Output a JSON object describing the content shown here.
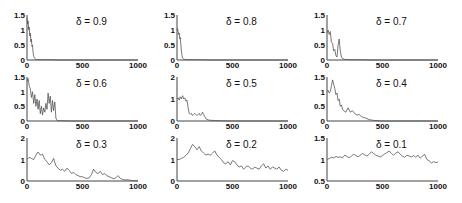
{
  "figure": {
    "title": "",
    "rows": 3,
    "cols": 3
  },
  "chart_data": [
    {
      "type": "line",
      "title": "δ = 0.9",
      "xlabel": "",
      "ylabel": "",
      "xlim": [
        0,
        1000
      ],
      "ylim": [
        0,
        1.5
      ],
      "xticks": [
        "0",
        "500",
        "1000"
      ],
      "yticks": [
        "0",
        "0.5",
        "1",
        "1.5"
      ],
      "x": [
        0,
        5,
        10,
        15,
        20,
        25,
        30,
        35,
        40,
        45,
        50,
        55,
        60,
        70,
        80,
        100,
        200,
        300,
        400,
        500,
        600,
        700,
        800,
        900,
        1000
      ],
      "values": [
        1.4,
        1.2,
        1.3,
        1.0,
        1.1,
        0.8,
        0.9,
        0.6,
        0.7,
        0.45,
        0.5,
        0.25,
        0.12,
        0.05,
        0.02,
        0.01,
        0.01,
        0.0,
        0.0,
        0.0,
        0.0,
        0.0,
        0.0,
        0.0,
        0.0
      ]
    },
    {
      "type": "line",
      "title": "δ = 0.8",
      "xlabel": "",
      "ylabel": "",
      "xlim": [
        0,
        1000
      ],
      "ylim": [
        0,
        1.5
      ],
      "xticks": [
        "0",
        "500",
        "1000"
      ],
      "yticks": [
        "0",
        "0.5",
        "1",
        "1.5"
      ],
      "x": [
        0,
        5,
        10,
        15,
        20,
        25,
        30,
        35,
        40,
        45,
        50,
        60,
        70,
        100,
        200,
        300,
        400,
        500,
        600,
        700,
        800,
        900,
        1000
      ],
      "values": [
        1.0,
        1.05,
        0.95,
        0.85,
        0.9,
        0.7,
        0.75,
        0.5,
        0.3,
        0.15,
        0.06,
        0.03,
        0.02,
        0.01,
        0.01,
        0.0,
        0.0,
        0.0,
        0.0,
        0.0,
        0.0,
        0.0,
        0.0
      ]
    },
    {
      "type": "line",
      "title": "δ = 0.7",
      "xlabel": "",
      "ylabel": "",
      "xlim": [
        0,
        1000
      ],
      "ylim": [
        0,
        1.5
      ],
      "xticks": [
        "0",
        "500",
        "1000"
      ],
      "yticks": [
        "0",
        "0.5",
        "1",
        "1.5"
      ],
      "x": [
        0,
        10,
        20,
        30,
        40,
        50,
        60,
        70,
        80,
        90,
        100,
        110,
        120,
        130,
        140,
        160,
        200,
        300,
        400,
        500,
        600,
        700,
        800,
        900,
        1000
      ],
      "values": [
        0.9,
        1.0,
        0.85,
        0.95,
        0.6,
        0.55,
        0.3,
        0.35,
        0.15,
        0.1,
        0.5,
        0.7,
        0.3,
        0.1,
        0.05,
        0.02,
        0.01,
        0.01,
        0.0,
        0.0,
        0.0,
        0.0,
        0.0,
        0.0,
        0.0
      ]
    },
    {
      "type": "line",
      "title": "δ = 0.6",
      "xlabel": "",
      "ylabel": "",
      "xlim": [
        0,
        1000
      ],
      "ylim": [
        0,
        1.5
      ],
      "xticks": [
        "0",
        "500",
        "1000"
      ],
      "yticks": [
        "0",
        "0.5",
        "1",
        "1.5"
      ],
      "x": [
        0,
        10,
        20,
        30,
        40,
        50,
        60,
        70,
        80,
        90,
        100,
        110,
        120,
        130,
        140,
        150,
        160,
        170,
        180,
        190,
        200,
        210,
        220,
        230,
        240,
        250,
        260,
        270,
        280,
        300,
        400,
        500,
        600,
        700,
        800,
        900,
        1000
      ],
      "values": [
        1.35,
        1.45,
        1.2,
        1.1,
        0.8,
        1.0,
        0.6,
        0.9,
        0.5,
        0.75,
        0.4,
        0.7,
        0.25,
        0.5,
        0.2,
        0.45,
        0.3,
        0.6,
        0.4,
        0.95,
        0.6,
        0.85,
        0.3,
        0.7,
        0.35,
        0.65,
        0.1,
        0.02,
        0.01,
        0.01,
        0.0,
        0.0,
        0.0,
        0.0,
        0.0,
        0.0,
        0.0
      ]
    },
    {
      "type": "line",
      "title": "δ = 0.5",
      "xlabel": "",
      "ylabel": "",
      "xlim": [
        0,
        1000
      ],
      "ylim": [
        0,
        2
      ],
      "xticks": [
        "0",
        "500",
        "1000"
      ],
      "yticks": [
        "0",
        "1",
        "2"
      ],
      "x": [
        0,
        10,
        20,
        30,
        40,
        50,
        60,
        70,
        80,
        90,
        100,
        110,
        120,
        130,
        140,
        150,
        160,
        170,
        180,
        190,
        200,
        210,
        220,
        230,
        240,
        250,
        260,
        280,
        300,
        400,
        500,
        600,
        700,
        800,
        900,
        1000
      ],
      "values": [
        1.0,
        1.05,
        0.95,
        1.1,
        1.0,
        1.15,
        1.0,
        1.05,
        0.9,
        0.95,
        0.6,
        0.35,
        0.3,
        0.35,
        0.25,
        0.3,
        0.35,
        0.3,
        0.25,
        0.3,
        0.35,
        0.25,
        0.3,
        0.4,
        0.3,
        0.2,
        0.1,
        0.05,
        0.03,
        0.01,
        0.0,
        0.0,
        0.0,
        0.0,
        0.0,
        0.0
      ]
    },
    {
      "type": "line",
      "title": "δ = 0.4",
      "xlabel": "",
      "ylabel": "",
      "xlim": [
        0,
        1000
      ],
      "ylim": [
        0,
        1.5
      ],
      "xticks": [
        "0",
        "500",
        "1000"
      ],
      "yticks": [
        "0",
        "0.5",
        "1",
        "1.5"
      ],
      "x": [
        0,
        10,
        20,
        30,
        40,
        50,
        60,
        70,
        80,
        90,
        100,
        110,
        120,
        130,
        140,
        150,
        170,
        190,
        210,
        230,
        250,
        270,
        290,
        310,
        330,
        350,
        370,
        390,
        420,
        460,
        500,
        600,
        700,
        800,
        900,
        1000
      ],
      "values": [
        1.0,
        1.05,
        0.95,
        1.0,
        1.2,
        1.4,
        1.25,
        1.1,
        0.9,
        0.95,
        0.7,
        0.75,
        0.5,
        0.55,
        0.4,
        0.35,
        0.3,
        0.45,
        0.3,
        0.35,
        0.25,
        0.2,
        0.22,
        0.15,
        0.12,
        0.1,
        0.06,
        0.04,
        0.02,
        0.01,
        0.0,
        0.0,
        0.0,
        0.0,
        0.0,
        0.0
      ]
    },
    {
      "type": "line",
      "title": "δ = 0.3",
      "xlabel": "",
      "ylabel": "",
      "xlim": [
        0,
        1000
      ],
      "ylim": [
        0,
        2
      ],
      "xticks": [
        "0",
        "500",
        "1000"
      ],
      "yticks": [
        "0",
        "1",
        "2"
      ],
      "x": [
        0,
        20,
        40,
        60,
        80,
        100,
        120,
        140,
        160,
        180,
        200,
        220,
        240,
        260,
        280,
        300,
        320,
        340,
        360,
        380,
        400,
        420,
        440,
        460,
        480,
        500,
        520,
        540,
        560,
        580,
        600,
        620,
        640,
        660,
        680,
        700,
        720,
        740,
        760,
        780,
        800,
        820,
        840,
        860,
        880,
        900,
        920,
        940,
        960,
        980,
        1000
      ],
      "values": [
        1.0,
        1.1,
        1.05,
        1.0,
        1.2,
        1.35,
        1.2,
        1.25,
        1.0,
        0.9,
        0.75,
        0.85,
        1.05,
        0.7,
        0.6,
        0.5,
        0.55,
        0.45,
        0.6,
        0.5,
        0.35,
        0.4,
        0.3,
        0.25,
        0.2,
        0.2,
        0.15,
        0.12,
        0.15,
        0.3,
        0.55,
        0.4,
        0.35,
        0.45,
        0.3,
        0.35,
        0.25,
        0.2,
        0.15,
        0.1,
        0.15,
        0.25,
        0.12,
        0.08,
        0.05,
        0.06,
        0.04,
        0.03,
        0.02,
        0.01,
        0.01
      ]
    },
    {
      "type": "line",
      "title": "δ = 0.2",
      "xlabel": "",
      "ylabel": "",
      "xlim": [
        0,
        1000
      ],
      "ylim": [
        0,
        2
      ],
      "xticks": [
        "0",
        "500",
        "1000"
      ],
      "yticks": [
        "0",
        "1",
        "2"
      ],
      "x": [
        0,
        20,
        40,
        60,
        80,
        100,
        120,
        140,
        160,
        180,
        200,
        220,
        240,
        260,
        280,
        300,
        320,
        340,
        360,
        380,
        400,
        420,
        440,
        460,
        480,
        500,
        520,
        540,
        560,
        580,
        600,
        620,
        640,
        660,
        680,
        700,
        720,
        740,
        760,
        780,
        800,
        820,
        840,
        860,
        880,
        900,
        920,
        940,
        960,
        980,
        1000
      ],
      "values": [
        1.0,
        1.0,
        1.05,
        1.1,
        1.2,
        1.3,
        1.5,
        1.7,
        1.6,
        1.45,
        1.6,
        1.4,
        1.3,
        1.2,
        1.25,
        1.2,
        1.3,
        1.4,
        1.2,
        1.1,
        1.0,
        0.85,
        0.8,
        0.9,
        0.75,
        0.95,
        0.9,
        0.75,
        0.65,
        0.7,
        0.55,
        0.65,
        0.7,
        0.6,
        0.55,
        0.65,
        0.6,
        0.55,
        0.7,
        0.8,
        0.6,
        0.7,
        0.55,
        0.65,
        0.6,
        0.55,
        0.65,
        0.5,
        0.45,
        0.55,
        0.5
      ]
    },
    {
      "type": "line",
      "title": "δ = 0.1",
      "xlabel": "",
      "ylabel": "",
      "xlim": [
        0,
        1000
      ],
      "ylim": [
        0.5,
        1.5
      ],
      "xticks": [
        "0",
        "500",
        "1000"
      ],
      "yticks": [
        "0.5",
        "1",
        "1.5"
      ],
      "x": [
        0,
        20,
        40,
        60,
        80,
        100,
        120,
        140,
        160,
        180,
        200,
        220,
        240,
        260,
        280,
        300,
        320,
        340,
        360,
        380,
        400,
        420,
        440,
        460,
        480,
        500,
        520,
        540,
        560,
        580,
        600,
        620,
        640,
        660,
        680,
        700,
        720,
        740,
        760,
        780,
        800,
        820,
        840,
        860,
        880,
        900,
        920,
        940,
        960,
        980,
        1000
      ],
      "values": [
        1.0,
        1.02,
        1.05,
        1.04,
        1.07,
        1.05,
        1.06,
        1.04,
        1.1,
        1.07,
        1.04,
        1.08,
        1.12,
        1.09,
        1.06,
        1.1,
        1.14,
        1.11,
        1.08,
        1.12,
        1.18,
        1.14,
        1.1,
        1.08,
        1.06,
        1.09,
        1.13,
        1.16,
        1.2,
        1.14,
        1.1,
        1.15,
        1.18,
        1.12,
        1.08,
        1.05,
        1.1,
        1.08,
        1.06,
        1.09,
        1.05,
        1.1,
        1.03,
        1.08,
        1.12,
        1.0,
        0.97,
        0.92,
        0.95,
        0.93,
        0.94
      ]
    }
  ],
  "style": {
    "line_color": "#555555",
    "axis_color": "#444444",
    "text_color": "#111111"
  }
}
